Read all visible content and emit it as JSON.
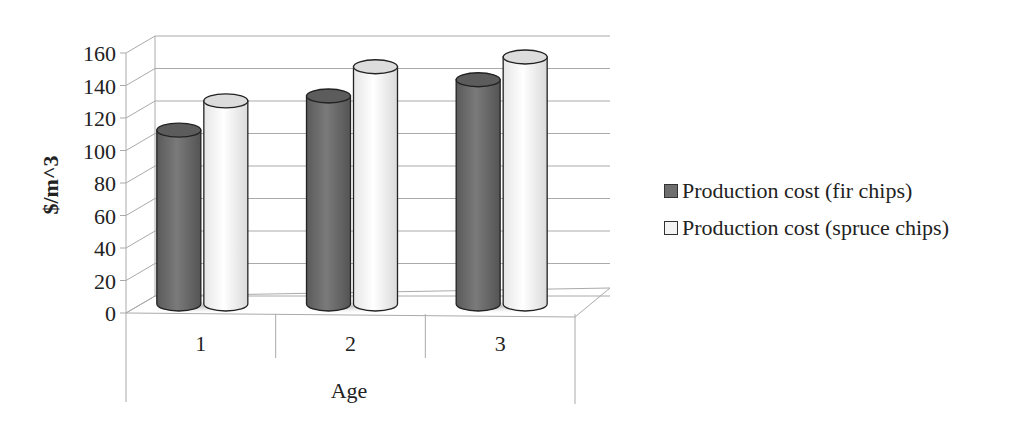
{
  "chart_data": {
    "type": "bar",
    "style": "3d-cylinder",
    "title": "",
    "xlabel": "Age",
    "ylabel": "$/m^3",
    "categories": [
      "1",
      "2",
      "3"
    ],
    "series": [
      {
        "name": "Production cost (fir chips)",
        "color": "#6e6e6e",
        "values": [
          107,
          128,
          138
        ]
      },
      {
        "name": "Production cost (spruce chips)",
        "color": "#f4f4f4",
        "values": [
          125,
          146,
          152
        ]
      }
    ],
    "ylim": [
      0,
      160
    ],
    "yticks": [
      "0",
      "20",
      "40",
      "60",
      "80",
      "100",
      "120",
      "140",
      "160"
    ],
    "grid": true,
    "legend_position": "right"
  },
  "legend": {
    "items": [
      {
        "label": "Production cost (fir chips)",
        "color": "#6e6e6e"
      },
      {
        "label": "Production cost (spruce chips)",
        "color": "#f4f4f4"
      }
    ]
  }
}
